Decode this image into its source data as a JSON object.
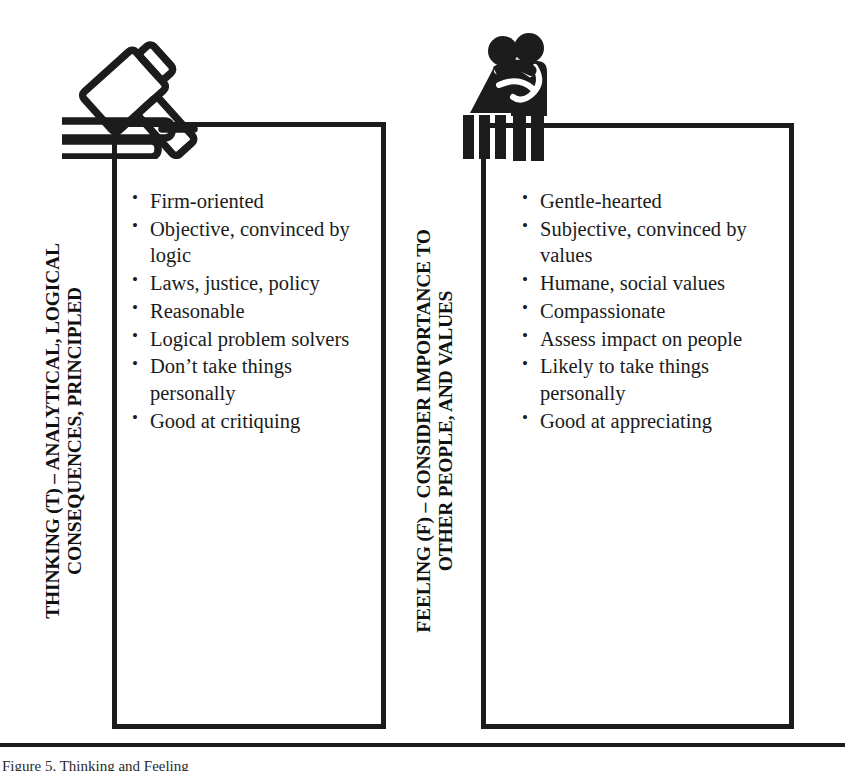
{
  "page": {
    "background_color": "#ffffff",
    "ink_color": "#1c1c1c",
    "bottom_caption_clipped": "Figure 5. Thinking and Feeling"
  },
  "panels": [
    {
      "id": "thinking",
      "icon_name": "gavel-icon",
      "vertical_label_lines": [
        "THINKING (T) – ANALYTICAL, LOGICAL",
        "CONSEQUENCES, PRINCIPLED"
      ],
      "bullets": [
        "Firm-oriented",
        "Objective, convinced by logic",
        "Laws, justice, policy",
        "Reasonable",
        "Logical problem solvers",
        "Don’t take things personally",
        "Good at critiquing"
      ]
    },
    {
      "id": "feeling",
      "icon_name": "embracing-couple-icon",
      "vertical_label_lines": [
        "FEELING (F) – CONSIDER IMPORTANCE TO",
        "OTHER PEOPLE, AND VALUES"
      ],
      "bullets": [
        "Gentle-hearted",
        "Subjective, convinced by values",
        "Humane, social values",
        "Compassionate",
        "Assess impact on people",
        "Likely to take things personally",
        "Good at appreciating"
      ]
    }
  ]
}
